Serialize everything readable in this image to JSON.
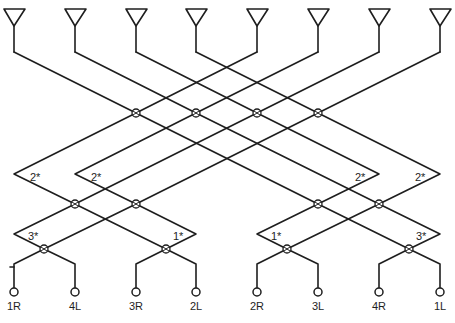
{
  "diagram": {
    "type": "butler-matrix-beamforming-network",
    "antenna_count": 8,
    "antenna_x": [
      14,
      75,
      136,
      196,
      257,
      318,
      379,
      440
    ],
    "coupler_stage1": [
      [
        136,
        113
      ],
      [
        196,
        113
      ],
      [
        257,
        113
      ],
      [
        318,
        113
      ]
    ],
    "coupler_stage2": [
      [
        75,
        204
      ],
      [
        136,
        204
      ],
      [
        318,
        204
      ],
      [
        379,
        204
      ]
    ],
    "coupler_stage3": [
      [
        44,
        248
      ],
      [
        166,
        248
      ],
      [
        287,
        248
      ],
      [
        409,
        248
      ]
    ],
    "phase_shifter_labels": {
      "stage1": [
        "2*",
        "2*",
        "2*",
        "2*"
      ],
      "stage2": [
        "3*",
        "1*",
        "1*",
        "3*"
      ]
    },
    "ports": [
      "1R",
      "4L",
      "3R",
      "2L",
      "2R",
      "3L",
      "4R",
      "1L"
    ],
    "colors": {
      "line": "#1e1e1e",
      "background": "#ffffff"
    }
  }
}
